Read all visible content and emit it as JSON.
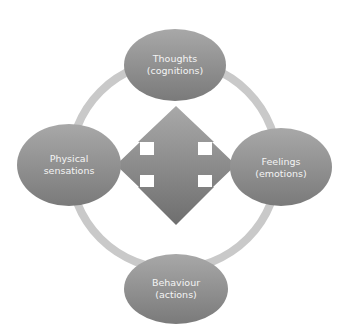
{
  "diagram": {
    "type": "cycle-with-central-arrows",
    "colors": {
      "background": "#ffffff",
      "ring": "#c9c9c9",
      "node_light": "#a6a6a6",
      "node_dark": "#7a7a7a",
      "arrow_light": "#a8a8a8",
      "arrow_dark": "#6f6f6f",
      "text": "#f4f4f4"
    },
    "nodes": [
      {
        "position": "top",
        "line1": "Thoughts",
        "line2": "(cognitions)"
      },
      {
        "position": "right",
        "line1": "Feelings",
        "line2": "(emotions)"
      },
      {
        "position": "bottom",
        "line1": "Behaviour",
        "line2": "(actions)"
      },
      {
        "position": "left",
        "line1": "Physical",
        "line2": "sensations"
      }
    ],
    "center_icon": "four-way-arrow"
  }
}
